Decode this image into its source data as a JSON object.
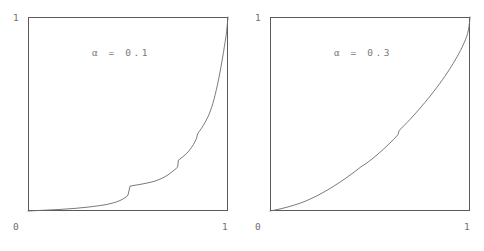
{
  "figure": {
    "background_color": "#ffffff",
    "line_color": "#6b6b6b",
    "frame_color": "#5a5a5a",
    "text_color": "#6e6e6e"
  },
  "panels": [
    {
      "id": "panel-alpha-0-1",
      "annotation": "α  =  0.1",
      "axis": {
        "y_max_label": "1",
        "y_min_label": "0",
        "x_max_label": "1"
      }
    },
    {
      "id": "panel-alpha-0-3",
      "annotation": "α  =  0.3",
      "axis": {
        "y_max_label": "1",
        "y_min_label": "0",
        "x_max_label": "1"
      }
    }
  ],
  "chart_data": [
    {
      "type": "line",
      "title": "α  =  0.1",
      "xlabel": "",
      "ylabel": "",
      "xlim": [
        0,
        1
      ],
      "ylim": [
        0,
        1
      ],
      "xticks": [
        0,
        1
      ],
      "yticks": [
        0,
        1
      ],
      "xticklabels": [
        "0",
        "1"
      ],
      "yticklabels": [
        "0",
        "1"
      ],
      "grid": false,
      "legend": false,
      "annotations": [
        {
          "text": "α  =  0.1",
          "x": 0.5,
          "y": 0.845
        }
      ],
      "series": [
        {
          "name": "cdf-alpha-0.1",
          "x": [
            0.0,
            0.04,
            0.08,
            0.12,
            0.16,
            0.2,
            0.24,
            0.27,
            0.3,
            0.33,
            0.36,
            0.39,
            0.42,
            0.44,
            0.46,
            0.475,
            0.49,
            0.5,
            0.51,
            0.53,
            0.56,
            0.59,
            0.62,
            0.64,
            0.66,
            0.68,
            0.7,
            0.72,
            0.735,
            0.748,
            0.752,
            0.76,
            0.775,
            0.79,
            0.805,
            0.818,
            0.828,
            0.836,
            0.842,
            0.848,
            0.856,
            0.866,
            0.876,
            0.886,
            0.894,
            0.9,
            0.906,
            0.912,
            0.918,
            0.924,
            0.93,
            0.936,
            0.942,
            0.948,
            0.954,
            0.96,
            0.965,
            0.97,
            0.974,
            0.978,
            0.982,
            0.986,
            0.99,
            0.993,
            0.996,
            0.998,
            1.0
          ],
          "y": [
            0.0,
            0.002,
            0.004,
            0.006,
            0.008,
            0.011,
            0.014,
            0.017,
            0.02,
            0.024,
            0.028,
            0.033,
            0.04,
            0.046,
            0.054,
            0.062,
            0.072,
            0.082,
            0.128,
            0.132,
            0.137,
            0.143,
            0.15,
            0.156,
            0.164,
            0.174,
            0.186,
            0.202,
            0.214,
            0.226,
            0.262,
            0.268,
            0.28,
            0.294,
            0.31,
            0.328,
            0.344,
            0.36,
            0.372,
            0.398,
            0.41,
            0.424,
            0.44,
            0.458,
            0.474,
            0.486,
            0.5,
            0.516,
            0.534,
            0.554,
            0.576,
            0.6,
            0.626,
            0.654,
            0.684,
            0.716,
            0.744,
            0.774,
            0.798,
            0.822,
            0.848,
            0.874,
            0.9,
            0.926,
            0.954,
            0.978,
            1.0
          ]
        }
      ]
    },
    {
      "type": "line",
      "title": "α  =  0.3",
      "xlabel": "",
      "ylabel": "",
      "xlim": [
        0,
        1
      ],
      "ylim": [
        0,
        1
      ],
      "xticks": [
        0,
        1
      ],
      "yticks": [
        0,
        1
      ],
      "xticklabels": [
        "0",
        "1"
      ],
      "yticklabels": [
        "0",
        "1"
      ],
      "grid": false,
      "legend": false,
      "annotations": [
        {
          "text": "α  =  0.3",
          "x": 0.5,
          "y": 0.845
        }
      ],
      "series": [
        {
          "name": "cdf-alpha-0.3",
          "x": [
            0.0,
            0.03,
            0.06,
            0.09,
            0.12,
            0.15,
            0.18,
            0.21,
            0.24,
            0.27,
            0.3,
            0.32,
            0.34,
            0.36,
            0.38,
            0.4,
            0.42,
            0.44,
            0.455,
            0.47,
            0.485,
            0.5,
            0.515,
            0.53,
            0.545,
            0.56,
            0.575,
            0.59,
            0.605,
            0.618,
            0.63,
            0.64,
            0.645,
            0.655,
            0.67,
            0.685,
            0.7,
            0.715,
            0.73,
            0.745,
            0.76,
            0.775,
            0.79,
            0.805,
            0.82,
            0.835,
            0.85,
            0.862,
            0.874,
            0.886,
            0.896,
            0.906,
            0.916,
            0.926,
            0.936,
            0.944,
            0.952,
            0.96,
            0.966,
            0.972,
            0.978,
            0.983,
            0.988,
            0.992,
            0.995,
            0.998,
            1.0
          ],
          "y": [
            0.0,
            0.006,
            0.013,
            0.021,
            0.03,
            0.04,
            0.052,
            0.066,
            0.081,
            0.098,
            0.116,
            0.129,
            0.142,
            0.156,
            0.17,
            0.185,
            0.2,
            0.216,
            0.228,
            0.238,
            0.248,
            0.26,
            0.272,
            0.285,
            0.298,
            0.312,
            0.326,
            0.341,
            0.356,
            0.369,
            0.382,
            0.394,
            0.414,
            0.424,
            0.44,
            0.456,
            0.472,
            0.489,
            0.506,
            0.524,
            0.542,
            0.56,
            0.579,
            0.598,
            0.618,
            0.638,
            0.659,
            0.676,
            0.694,
            0.712,
            0.728,
            0.744,
            0.761,
            0.778,
            0.796,
            0.811,
            0.827,
            0.843,
            0.856,
            0.87,
            0.885,
            0.899,
            0.915,
            0.932,
            0.951,
            0.974,
            1.0
          ]
        }
      ]
    }
  ]
}
